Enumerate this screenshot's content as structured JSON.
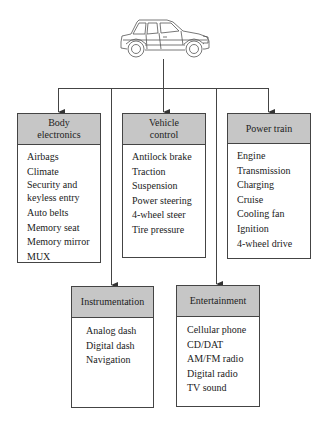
{
  "diagram": {
    "root": {
      "label": "Car",
      "icon": "car-icon"
    },
    "colors": {
      "header_fill": "#c6c6c6",
      "line": "#444444",
      "background": "#ffffff"
    },
    "boxes": [
      {
        "id": "body-electronics",
        "title": "Body electronics",
        "title_lines": [
          "Body",
          "electronics"
        ],
        "items": [
          "Airbags",
          "Climate",
          "Security and keyless entry",
          "Auto belts",
          "Memory seat",
          "Memory mirror",
          "MUX"
        ]
      },
      {
        "id": "vehicle-control",
        "title": "Vehicle control",
        "title_lines": [
          "Vehicle",
          "control"
        ],
        "items": [
          "Antilock brake",
          "Traction",
          "Suspension",
          "Power steering",
          "4-wheel steer",
          "Tire pressure"
        ]
      },
      {
        "id": "power-train",
        "title": "Power train",
        "title_lines": [
          "Power train"
        ],
        "items": [
          "Engine",
          "Transmission",
          "Charging",
          "Cruise",
          "Cooling fan",
          "Ignition",
          "4-wheel drive"
        ]
      },
      {
        "id": "instrumentation",
        "title": "Instrumentation",
        "title_lines": [
          "Instrumentation"
        ],
        "items": [
          "Analog dash",
          "Digital dash",
          "Navigation"
        ]
      },
      {
        "id": "entertainment",
        "title": "Entertainment",
        "title_lines": [
          "Entertainment"
        ],
        "items": [
          "Cellular phone",
          "CD/DAT",
          "AM/FM radio",
          "Digital radio",
          "TV sound"
        ]
      }
    ]
  }
}
